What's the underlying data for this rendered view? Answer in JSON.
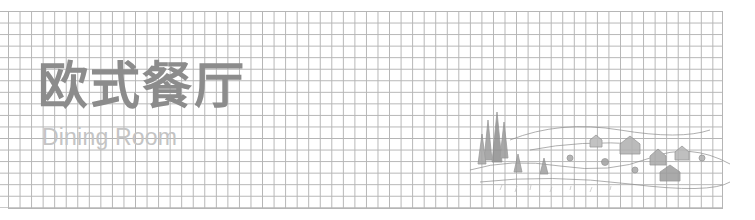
{
  "header": {
    "title": "欧式餐厅",
    "subtitle": "Dining Room"
  },
  "illustration": {
    "name": "village-landscape-sketch",
    "description": "pencil sketch of trees, cottages and fields"
  },
  "colors": {
    "grid_line": "#b5b5b5",
    "title": "#8c8c8c",
    "subtitle": "#c4c4c4",
    "sketch": "#8a8a8a"
  }
}
